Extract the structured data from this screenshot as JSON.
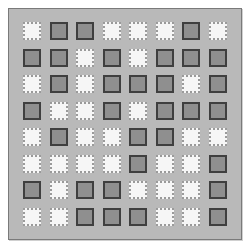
{
  "board": {
    "rows": 8,
    "cols": 8,
    "colors": {
      "dark": "#8f8f8f",
      "light": "#f6f6f6",
      "background": "#b9b9b9"
    },
    "cells": [
      [
        "L",
        "D",
        "D",
        "L",
        "L",
        "L",
        "D",
        "L"
      ],
      [
        "D",
        "D",
        "L",
        "D",
        "L",
        "D",
        "D",
        "D"
      ],
      [
        "L",
        "D",
        "L",
        "D",
        "D",
        "D",
        "L",
        "D"
      ],
      [
        "D",
        "L",
        "L",
        "D",
        "L",
        "D",
        "D",
        "D"
      ],
      [
        "L",
        "D",
        "L",
        "L",
        "D",
        "D",
        "L",
        "L"
      ],
      [
        "L",
        "L",
        "L",
        "L",
        "D",
        "L",
        "L",
        "D"
      ],
      [
        "D",
        "L",
        "D",
        "D",
        "L",
        "L",
        "L",
        "D"
      ],
      [
        "L",
        "L",
        "D",
        "D",
        "D",
        "L",
        "L",
        "D"
      ]
    ]
  }
}
